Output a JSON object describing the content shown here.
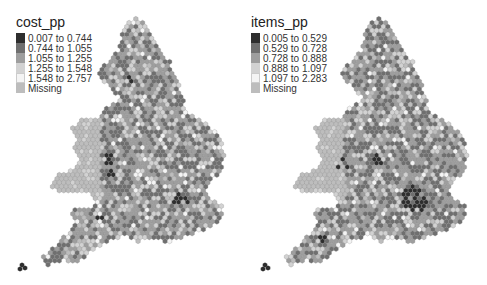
{
  "chart_data": [
    {
      "type": "hex_choropleth_map",
      "title": "cost_pp",
      "legend": {
        "title": "cost_pp",
        "entries": [
          {
            "label": "0.007 to 0.744",
            "color": "#2e2e2e"
          },
          {
            "label": "0.744 to 1.055",
            "color": "#6f6f6f"
          },
          {
            "label": "1.055 to 1.255",
            "color": "#9e9e9e"
          },
          {
            "label": "1.255 to 1.548",
            "color": "#d2d2d2"
          },
          {
            "label": "1.548 to 2.757",
            "color": "#f4f4f4"
          },
          {
            "label": "Missing",
            "color": "#bdbdbd"
          }
        ]
      },
      "region": "England and Wales"
    },
    {
      "type": "hex_choropleth_map",
      "title": "items_pp",
      "legend": {
        "title": "items_pp",
        "entries": [
          {
            "label": "0.005 to 0.529",
            "color": "#2e2e2e"
          },
          {
            "label": "0.529 to 0.728",
            "color": "#6f6f6f"
          },
          {
            "label": "0.728 to 0.888",
            "color": "#9e9e9e"
          },
          {
            "label": "0.888 to 1.097",
            "color": "#d2d2d2"
          },
          {
            "label": "1.097 to 2.283",
            "color": "#f4f4f4"
          },
          {
            "label": "Missing",
            "color": "#bdbdbd"
          }
        ]
      },
      "region": "England and Wales"
    }
  ],
  "maps": {
    "left": {
      "title": "cost_pp",
      "legend": [
        {
          "label": "0.007 to 0.744",
          "color": "#2e2e2e"
        },
        {
          "label": "0.744 to 1.055",
          "color": "#6f6f6f"
        },
        {
          "label": "1.055 to 1.255",
          "color": "#9e9e9e"
        },
        {
          "label": "1.255 to 1.548",
          "color": "#d2d2d2"
        },
        {
          "label": "1.548 to 2.757",
          "color": "#f4f4f4"
        },
        {
          "label": "Missing",
          "color": "#bdbdbd"
        }
      ]
    },
    "right": {
      "title": "items_pp",
      "legend": [
        {
          "label": "0.005 to 0.529",
          "color": "#2e2e2e"
        },
        {
          "label": "0.529 to 0.728",
          "color": "#6f6f6f"
        },
        {
          "label": "0.728 to 0.888",
          "color": "#9e9e9e"
        },
        {
          "label": "0.888 to 1.097",
          "color": "#d2d2d2"
        },
        {
          "label": "1.097 to 2.283",
          "color": "#f4f4f4"
        },
        {
          "label": "Missing",
          "color": "#bdbdbd"
        }
      ]
    }
  }
}
